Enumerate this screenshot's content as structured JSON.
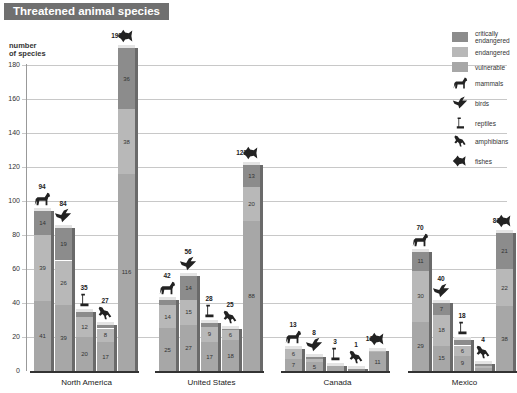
{
  "title": "Threatened animal species",
  "colors": {
    "critically_endangered": "#8c8c8c",
    "endangered": "#b8b8b8",
    "vulnerable": "#a7a7a7",
    "title_bg": "#707070"
  },
  "legend": {
    "critically_endangered": "critically endangered",
    "endangered": "endangered",
    "vulnerable": "vulnerable",
    "mammals": "mammals",
    "birds": "birds",
    "reptiles": "reptiles",
    "amphibians": "amphibians",
    "fishes": "fishes"
  },
  "axis": {
    "ylabel_line1": "number",
    "ylabel_line2": "of species",
    "ticks": [
      "0",
      "20",
      "40",
      "60",
      "80",
      "100",
      "120",
      "140",
      "160",
      "180"
    ]
  },
  "chart_data": {
    "type": "bar",
    "title": "Threatened animal species",
    "xlabel": "",
    "ylabel": "number of species",
    "ylim": [
      0,
      180
    ],
    "grid": true,
    "legend_position": "right",
    "stacked": true,
    "categories": [
      "North America",
      "United States",
      "Canada",
      "Mexico"
    ],
    "groups": [
      "mammals",
      "birds",
      "reptiles",
      "amphibians",
      "fishes"
    ],
    "stack_order": [
      "vulnerable",
      "endangered",
      "critically endangered"
    ],
    "data": {
      "North America": {
        "mammals": {
          "vulnerable": 41,
          "endangered": 39,
          "critically endangered": 14,
          "total": 94
        },
        "birds": {
          "vulnerable": 39,
          "endangered": 26,
          "critically endangered": 19,
          "total": 84
        },
        "reptiles": {
          "vulnerable": 20,
          "endangered": 12,
          "critically endangered": 3,
          "total": 35
        },
        "amphibians": {
          "vulnerable": 17,
          "endangered": 8,
          "critically endangered": 2,
          "total": 27
        },
        "fishes": {
          "vulnerable": 116,
          "endangered": 38,
          "critically endangered": 36,
          "total": 190
        }
      },
      "United States": {
        "mammals": {
          "vulnerable": 25,
          "endangered": 14,
          "critically endangered": 3,
          "total": 42
        },
        "birds": {
          "vulnerable": 27,
          "endangered": 15,
          "critically endangered": 14,
          "total": 56
        },
        "reptiles": {
          "vulnerable": 17,
          "endangered": 9,
          "critically endangered": 2,
          "total": 28
        },
        "amphibians": {
          "vulnerable": 18,
          "endangered": 6,
          "critically endangered": 1,
          "total": 25
        },
        "fishes": {
          "vulnerable": 88,
          "endangered": 20,
          "critically endangered": 13,
          "total": 121
        }
      },
      "Canada": {
        "mammals": {
          "vulnerable": 7,
          "endangered": 6,
          "critically endangered": 0,
          "total": 13
        },
        "birds": {
          "vulnerable": 5,
          "endangered": 2,
          "critically endangered": 1,
          "total": 8
        },
        "reptiles": {
          "vulnerable": 3,
          "endangered": 0,
          "critically endangered": 0,
          "total": 3
        },
        "amphibians": {
          "vulnerable": 0,
          "endangered": 0,
          "critically endangered": 1,
          "total": 1
        },
        "fishes": {
          "vulnerable": 11,
          "endangered": 1,
          "critically endangered": 0,
          "total": 12
        }
      },
      "Mexico": {
        "mammals": {
          "vulnerable": 29,
          "endangered": 30,
          "critically endangered": 11,
          "total": 70
        },
        "birds": {
          "vulnerable": 15,
          "endangered": 18,
          "critically endangered": 7,
          "total": 40
        },
        "reptiles": {
          "vulnerable": 9,
          "endangered": 6,
          "critically endangered": 3,
          "total": 18
        },
        "amphibians": {
          "vulnerable": 2,
          "endangered": 1,
          "critically endangered": 1,
          "total": 4
        },
        "fishes": {
          "vulnerable": 38,
          "endangered": 22,
          "critically endangered": 21,
          "total": 81
        }
      }
    }
  }
}
